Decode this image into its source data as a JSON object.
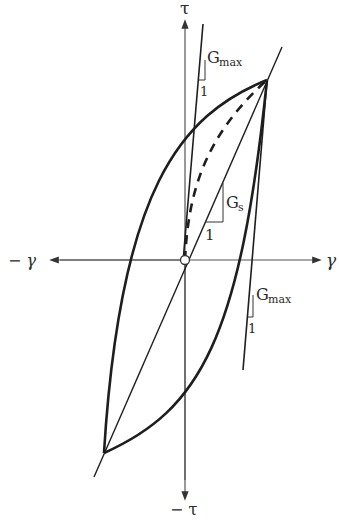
{
  "diagram": {
    "type": "hysteresis-loop",
    "axes": {
      "y_positive": "τ",
      "y_negative": "− τ",
      "x_positive": "γ",
      "x_negative": "− γ"
    },
    "labels": {
      "gmax_top_main": "G",
      "gmax_top_sub": "max",
      "gmax_top_one": "1",
      "gs_main": "G",
      "gs_sub": "s",
      "gs_one": "1",
      "gmax_bottom_main": "G",
      "gmax_bottom_sub": "max",
      "gmax_bottom_one": "1"
    },
    "colors": {
      "line": "#1e1e1e",
      "axis": "#555555",
      "text": "#2a2a2a"
    },
    "points": {
      "origin": [
        185,
        260
      ],
      "top_right_vertex": [
        267,
        80
      ],
      "bottom_left_vertex": [
        104,
        453
      ]
    }
  }
}
